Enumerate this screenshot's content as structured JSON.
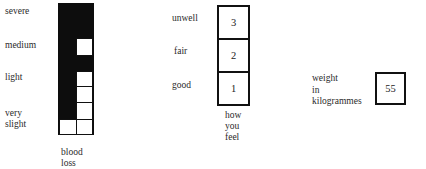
{
  "blood_loss": {
    "caption_line1": "blood",
    "caption_line2": "loss",
    "levels": {
      "severe": "severe",
      "medium": "medium",
      "light": "light",
      "very_slight_line1": "very",
      "very_slight_line2": "slight"
    }
  },
  "how_you_feel": {
    "caption_line1": "how",
    "caption_line2": "you",
    "caption_line3": "feel",
    "rows": [
      {
        "label": "unwell",
        "value": "3"
      },
      {
        "label": "fair",
        "value": "2"
      },
      {
        "label": "good",
        "value": "1"
      }
    ]
  },
  "weight": {
    "label_line1": "weight",
    "label_line2": "in",
    "label_line3": "kilogrammes",
    "value": "55"
  }
}
